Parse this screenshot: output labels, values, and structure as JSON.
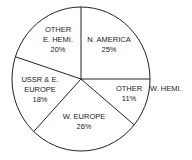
{
  "chart_data": {
    "type": "pie",
    "title": "",
    "categories": [
      "N. AMERICA",
      "OTHER W. HEMI.",
      "W. EUROPE",
      "USSR & E. EUROPE",
      "OTHER E. HEMI."
    ],
    "values": [
      25,
      11,
      26,
      18,
      20
    ],
    "unit": "%",
    "labels": [
      {
        "lines": [
          "N. AMERICA",
          "25%"
        ]
      },
      {
        "lines": [
          "OTHER",
          "11%"
        ],
        "outside": "W. HEMI."
      },
      {
        "lines": [
          "W. EUROPE",
          "26%"
        ]
      },
      {
        "lines": [
          "USSR & E.",
          "EUROPE",
          "18%"
        ]
      },
      {
        "lines": [
          "OTHER",
          "E. HEMI.",
          "20%"
        ]
      }
    ],
    "start_angle_deg": -90,
    "direction": "clockwise",
    "fill_color": "#ffffff",
    "stroke_color": "#222222",
    "legend": "none"
  }
}
